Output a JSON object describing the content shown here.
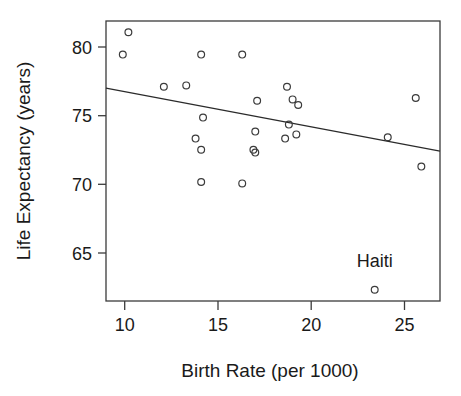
{
  "chart_data": {
    "type": "scatter",
    "title": "",
    "xlabel": "Birth Rate (per 1000)",
    "ylabel": "Life Expectancy (years)",
    "xlim": [
      9.0,
      26.9
    ],
    "ylim": [
      61.8,
      81.8
    ],
    "xticks": [
      10,
      15,
      20,
      25
    ],
    "yticks": [
      65,
      70,
      75,
      80
    ],
    "xtick_labels": [
      "10",
      "15",
      "20",
      "25"
    ],
    "ytick_labels": [
      "65",
      "70",
      "75",
      "80"
    ],
    "grid": false,
    "legend": "none",
    "points": [
      {
        "x": 10.2,
        "y": 81.0
      },
      {
        "x": 9.9,
        "y": 79.4
      },
      {
        "x": 14.1,
        "y": 79.4
      },
      {
        "x": 16.3,
        "y": 79.4
      },
      {
        "x": 12.1,
        "y": 77.1
      },
      {
        "x": 13.3,
        "y": 77.2
      },
      {
        "x": 18.7,
        "y": 77.1
      },
      {
        "x": 17.1,
        "y": 76.1
      },
      {
        "x": 19.0,
        "y": 76.2
      },
      {
        "x": 19.3,
        "y": 75.8
      },
      {
        "x": 25.6,
        "y": 76.3
      },
      {
        "x": 14.2,
        "y": 74.9
      },
      {
        "x": 18.8,
        "y": 74.4
      },
      {
        "x": 17.0,
        "y": 73.9
      },
      {
        "x": 13.8,
        "y": 73.4
      },
      {
        "x": 18.6,
        "y": 73.4
      },
      {
        "x": 19.2,
        "y": 73.7
      },
      {
        "x": 24.1,
        "y": 73.5
      },
      {
        "x": 14.1,
        "y": 72.6
      },
      {
        "x": 16.9,
        "y": 72.6
      },
      {
        "x": 17.0,
        "y": 72.4
      },
      {
        "x": 25.9,
        "y": 71.4
      },
      {
        "x": 14.1,
        "y": 70.3
      },
      {
        "x": 16.3,
        "y": 70.2
      },
      {
        "x": 23.4,
        "y": 62.6
      }
    ],
    "annotations": [
      {
        "text": "Haiti",
        "x": 23.4,
        "y": 64.2,
        "for_point": {
          "x": 23.4,
          "y": 62.6
        }
      }
    ],
    "trend_line": {
      "type": "linear-fit",
      "x_start": 9.0,
      "y_start": 77.0,
      "x_end": 26.9,
      "y_end": 72.5
    },
    "colors": {
      "point_stroke": "#3b3b3b",
      "line": "#2b2b2b",
      "axis": "#3b3b3b",
      "text": "#1a1a1a",
      "background": "#ffffff"
    }
  }
}
